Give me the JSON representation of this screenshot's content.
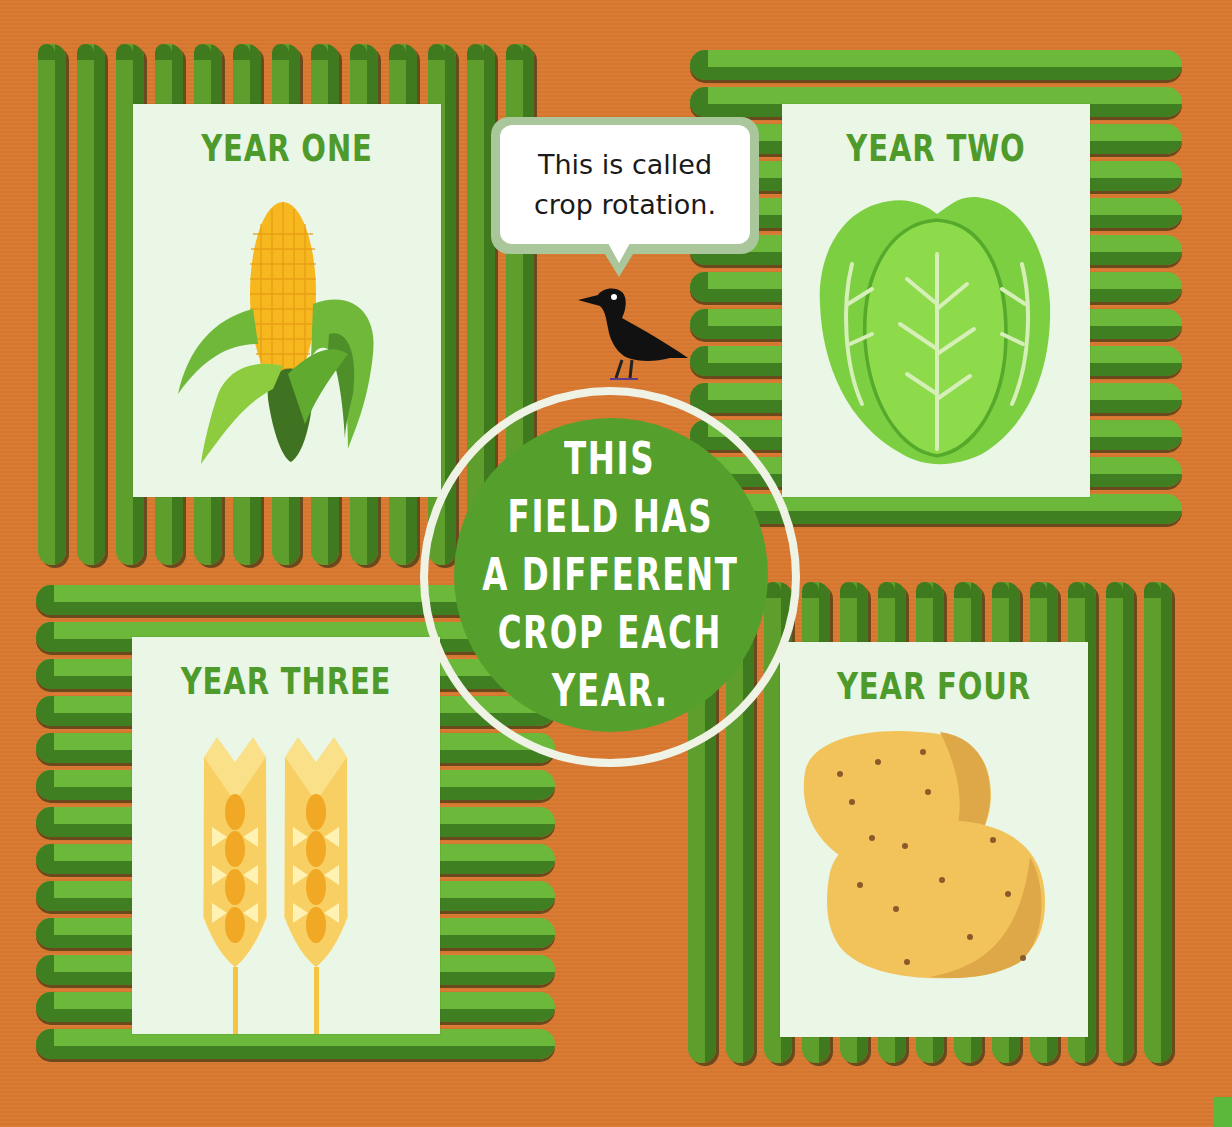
{
  "scene": {
    "background_color": "#d9782f",
    "row_light_green": "#6cb83a",
    "row_dark_green": "#3f7a1e",
    "card_color": "#eaf6e6",
    "title_green": "#4e9a2a"
  },
  "cards": [
    {
      "id": "year-one",
      "title": "YEAR ONE",
      "crop": "corn",
      "icon": "corn-icon"
    },
    {
      "id": "year-two",
      "title": "YEAR TWO",
      "crop": "lettuce",
      "icon": "lettuce-icon"
    },
    {
      "id": "year-three",
      "title": "YEAR THREE",
      "crop": "wheat",
      "icon": "wheat-icon"
    },
    {
      "id": "year-four",
      "title": "YEAR FOUR",
      "crop": "potatoes",
      "icon": "potato-icon"
    }
  ],
  "speech_bubble": {
    "lines": [
      "This is called",
      "crop rotation."
    ],
    "speaker": "crow"
  },
  "center_circle": {
    "lines": [
      "THIS",
      "FIELD HAS",
      "A DIFFERENT",
      "CROP EACH",
      "YEAR."
    ],
    "fill_color": "#55a02c",
    "ring_color": "#eef3e6"
  }
}
